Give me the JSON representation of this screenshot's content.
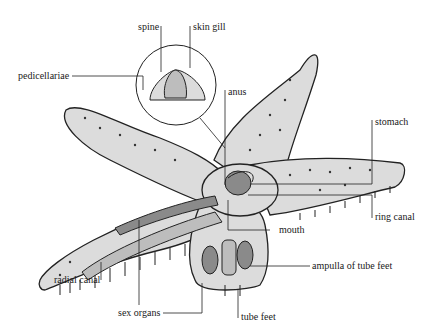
{
  "labels": {
    "spine": "spine",
    "skin_gill": "skin gill",
    "pedicellariae": "pedicellariae",
    "anus": "anus",
    "stomach": "stomach",
    "ring_canal": "ring canal",
    "mouth": "mouth",
    "ampulla": "ampulla of tube feet",
    "radial_canal": "radial canal",
    "sex_organs": "sex organs",
    "tube_feet": "tube feet"
  },
  "colors": {
    "body_fill": "#dcdcdc",
    "body_stroke": "#222222",
    "organ_fill": "#8a8a8a",
    "inner_fill": "#bdbdbd"
  }
}
